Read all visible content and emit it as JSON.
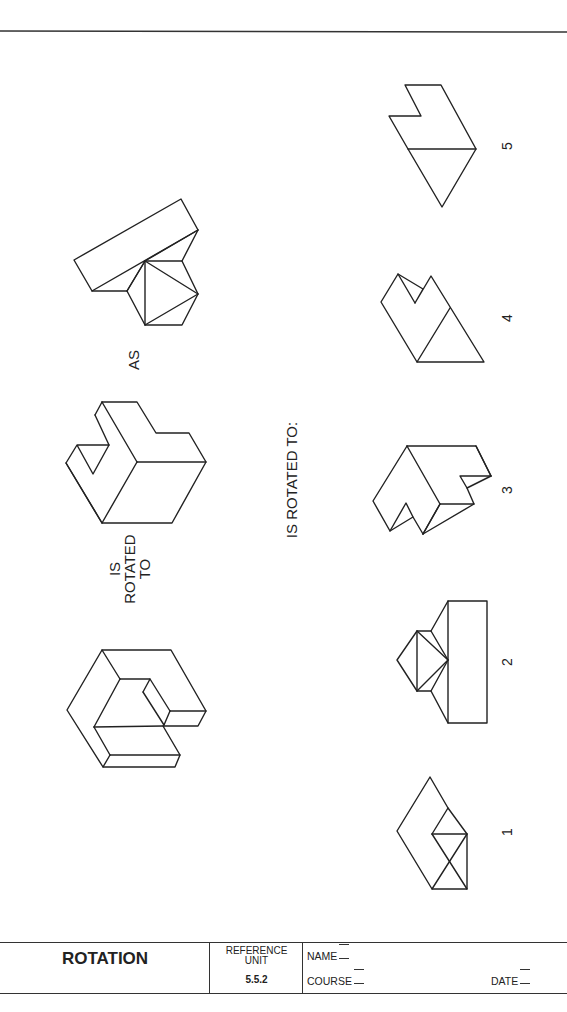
{
  "worksheet": {
    "top_rule": true,
    "prompt": {
      "is_rotated_to_stacked": [
        "IS",
        "ROTATED",
        "TO"
      ],
      "as_label": "AS",
      "question": "IS ROTATED TO:"
    },
    "figures": {
      "given_first": "rotated-cube-block-original",
      "given_second": "rotated-cube-block-result",
      "given_third": "reference-shape-block-with-hexagon"
    },
    "choices": [
      {
        "number": "1",
        "label": "1"
      },
      {
        "number": "2",
        "label": "2"
      },
      {
        "number": "3",
        "label": "3"
      },
      {
        "number": "4",
        "label": "4"
      },
      {
        "number": "5",
        "label": "5"
      }
    ]
  },
  "title_block": {
    "title": "ROTATION",
    "reference_label_line1": "REFERENCE",
    "reference_label_line2": "UNIT",
    "reference_number": "5.5.2",
    "name_label": "NAME",
    "course_label": "COURSE",
    "date_label": "DATE"
  },
  "colors": {
    "line": "#222222",
    "background": "#ffffff"
  }
}
